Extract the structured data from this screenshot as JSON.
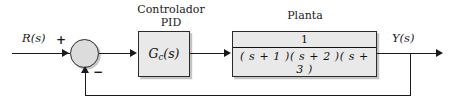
{
  "diagram": {
    "type": "control-block-diagram",
    "colors": {
      "line": "#1a1a1a",
      "block_fill": "#e9e9e9",
      "block_border": "#2b2b2b",
      "sum_fill": "#dcdcdc",
      "background": "#ffffff"
    }
  },
  "signals": {
    "input_label": "R(s)",
    "output_label": "Y(s)",
    "positive_sign": "+",
    "negative_sign": "−"
  },
  "blocks": [
    {
      "id": "controller",
      "caption_line1": "Controlador",
      "caption_line2": "PID",
      "body": "G",
      "body_subscript": "c",
      "body_suffix": "(s)"
    },
    {
      "id": "plant",
      "caption_line1": "Planta",
      "caption_line2": "",
      "numerator": "1",
      "denominator": "( s + 1 )( s + 2 )( s + 3 )"
    }
  ],
  "summing_junction": {
    "name": "summing-junction",
    "inputs": [
      "+",
      "−"
    ]
  }
}
